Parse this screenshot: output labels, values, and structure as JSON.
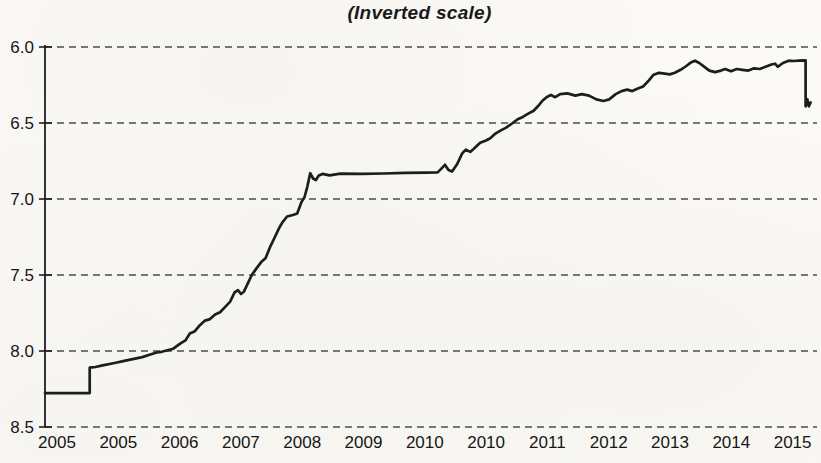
{
  "chart_data": {
    "type": "line",
    "title": "(Inverted scale)",
    "subtitle": "",
    "legend": "none",
    "grid": "dashed-horizontal",
    "y_axis": {
      "inverted": true,
      "top_value": 6.0,
      "bottom_value": 8.5,
      "tick_labels": [
        "6.0",
        "6.5",
        "7.0",
        "7.5",
        "8.0",
        "8.5"
      ],
      "tick_values": [
        6.0,
        6.5,
        7.0,
        7.5,
        8.0,
        8.5
      ]
    },
    "x_axis": {
      "tick_labels": [
        "2005",
        "2005",
        "2006",
        "2007",
        "2008",
        "2009",
        "2010",
        "2010",
        "2011",
        "2012",
        "2013",
        "2014",
        "2015"
      ],
      "start_year": 2005.0,
      "end_year": 2015.63
    },
    "series": [
      {
        "points": [
          [
            2005.0,
            8.277
          ],
          [
            2005.62,
            8.277
          ],
          [
            2005.62,
            8.11
          ],
          [
            2005.7,
            8.105
          ],
          [
            2005.8,
            8.095
          ],
          [
            2005.95,
            8.08
          ],
          [
            2006.1,
            8.065
          ],
          [
            2006.25,
            8.05
          ],
          [
            2006.35,
            8.04
          ],
          [
            2006.45,
            8.025
          ],
          [
            2006.55,
            8.01
          ],
          [
            2006.62,
            8.005
          ],
          [
            2006.7,
            7.995
          ],
          [
            2006.78,
            7.985
          ],
          [
            2006.88,
            7.95
          ],
          [
            2006.95,
            7.93
          ],
          [
            2007.01,
            7.885
          ],
          [
            2007.08,
            7.87
          ],
          [
            2007.15,
            7.83
          ],
          [
            2007.22,
            7.8
          ],
          [
            2007.29,
            7.79
          ],
          [
            2007.36,
            7.76
          ],
          [
            2007.43,
            7.745
          ],
          [
            2007.5,
            7.71
          ],
          [
            2007.57,
            7.675
          ],
          [
            2007.63,
            7.615
          ],
          [
            2007.68,
            7.6
          ],
          [
            2007.72,
            7.625
          ],
          [
            2007.76,
            7.61
          ],
          [
            2007.82,
            7.55
          ],
          [
            2007.87,
            7.5
          ],
          [
            2007.93,
            7.46
          ],
          [
            2008.0,
            7.415
          ],
          [
            2008.06,
            7.39
          ],
          [
            2008.13,
            7.31
          ],
          [
            2008.19,
            7.25
          ],
          [
            2008.25,
            7.19
          ],
          [
            2008.3,
            7.15
          ],
          [
            2008.36,
            7.115
          ],
          [
            2008.44,
            7.105
          ],
          [
            2008.5,
            7.095
          ],
          [
            2008.56,
            7.02
          ],
          [
            2008.6,
            6.99
          ],
          [
            2008.64,
            6.92
          ],
          [
            2008.68,
            6.83
          ],
          [
            2008.72,
            6.865
          ],
          [
            2008.76,
            6.875
          ],
          [
            2008.8,
            6.845
          ],
          [
            2008.85,
            6.835
          ],
          [
            2008.95,
            6.845
          ],
          [
            2009.1,
            6.833
          ],
          [
            2009.4,
            6.834
          ],
          [
            2009.7,
            6.832
          ],
          [
            2010.0,
            6.828
          ],
          [
            2010.3,
            6.826
          ],
          [
            2010.45,
            6.825
          ],
          [
            2010.52,
            6.79
          ],
          [
            2010.55,
            6.775
          ],
          [
            2010.6,
            6.81
          ],
          [
            2010.65,
            6.82
          ],
          [
            2010.72,
            6.77
          ],
          [
            2010.79,
            6.7
          ],
          [
            2010.84,
            6.675
          ],
          [
            2010.9,
            6.69
          ],
          [
            2010.95,
            6.67
          ],
          [
            2011.04,
            6.63
          ],
          [
            2011.12,
            6.615
          ],
          [
            2011.18,
            6.6
          ],
          [
            2011.25,
            6.57
          ],
          [
            2011.32,
            6.55
          ],
          [
            2011.4,
            6.53
          ],
          [
            2011.49,
            6.5
          ],
          [
            2011.56,
            6.475
          ],
          [
            2011.63,
            6.46
          ],
          [
            2011.7,
            6.44
          ],
          [
            2011.78,
            6.42
          ],
          [
            2011.84,
            6.39
          ],
          [
            2011.9,
            6.355
          ],
          [
            2011.96,
            6.33
          ],
          [
            2012.02,
            6.315
          ],
          [
            2012.08,
            6.33
          ],
          [
            2012.15,
            6.31
          ],
          [
            2012.25,
            6.305
          ],
          [
            2012.36,
            6.32
          ],
          [
            2012.45,
            6.31
          ],
          [
            2012.55,
            6.32
          ],
          [
            2012.65,
            6.345
          ],
          [
            2012.75,
            6.355
          ],
          [
            2012.83,
            6.345
          ],
          [
            2012.92,
            6.31
          ],
          [
            2013.0,
            6.29
          ],
          [
            2013.08,
            6.28
          ],
          [
            2013.15,
            6.29
          ],
          [
            2013.22,
            6.275
          ],
          [
            2013.3,
            6.26
          ],
          [
            2013.38,
            6.22
          ],
          [
            2013.44,
            6.185
          ],
          [
            2013.52,
            6.17
          ],
          [
            2013.6,
            6.175
          ],
          [
            2013.67,
            6.18
          ],
          [
            2013.74,
            6.17
          ],
          [
            2013.82,
            6.15
          ],
          [
            2013.9,
            6.125
          ],
          [
            2013.97,
            6.1
          ],
          [
            2014.02,
            6.09
          ],
          [
            2014.08,
            6.105
          ],
          [
            2014.15,
            6.13
          ],
          [
            2014.22,
            6.155
          ],
          [
            2014.3,
            6.165
          ],
          [
            2014.38,
            6.155
          ],
          [
            2014.44,
            6.145
          ],
          [
            2014.52,
            6.16
          ],
          [
            2014.6,
            6.145
          ],
          [
            2014.68,
            6.15
          ],
          [
            2014.76,
            6.155
          ],
          [
            2014.84,
            6.14
          ],
          [
            2014.92,
            6.145
          ],
          [
            2015.0,
            6.13
          ],
          [
            2015.08,
            6.115
          ],
          [
            2015.13,
            6.11
          ],
          [
            2015.17,
            6.13
          ],
          [
            2015.24,
            6.105
          ],
          [
            2015.32,
            6.09
          ],
          [
            2015.39,
            6.092
          ],
          [
            2015.46,
            6.09
          ],
          [
            2015.54,
            6.088
          ],
          [
            2015.555,
            6.088
          ],
          [
            2015.555,
            6.39
          ],
          [
            2015.58,
            6.345
          ],
          [
            2015.6,
            6.39
          ],
          [
            2015.625,
            6.365
          ]
        ]
      }
    ]
  },
  "colors": {
    "line": "#1d1d1d",
    "grid": "#4d4d4d",
    "axis": "#1f1f1f",
    "text": "#161616",
    "background": "#fbfaf6"
  }
}
